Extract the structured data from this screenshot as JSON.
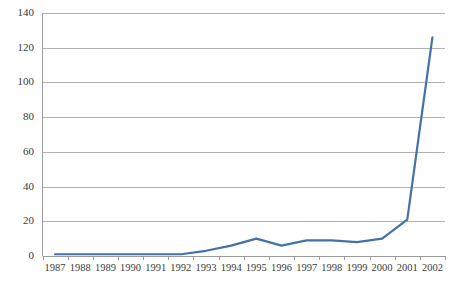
{
  "chart_data": {
    "type": "line",
    "title": "",
    "subtitle": "",
    "xlabel": "",
    "ylabel": "",
    "categories": [
      "1987",
      "1988",
      "1989",
      "1990",
      "1991",
      "1992",
      "1993",
      "1994",
      "1995",
      "1996",
      "1997",
      "1998",
      "1999",
      "2000",
      "2001",
      "2002"
    ],
    "series": [
      {
        "name": "Series 1",
        "values": [
          1,
          1,
          1,
          1,
          1,
          1,
          3,
          6,
          10,
          6,
          9,
          9,
          8,
          10,
          21,
          126
        ],
        "color": "#4472a8"
      }
    ],
    "ylim": [
      0,
      140
    ],
    "yticks": [
      0,
      20,
      40,
      60,
      80,
      100,
      120,
      140
    ],
    "ytick_labels": [
      "0",
      "20",
      "40",
      "60",
      "80",
      "100",
      "120",
      "140"
    ],
    "grid": "horizontal",
    "legend": "none",
    "plot_background": "#ffffff",
    "gridline_color": "#b3b3b3",
    "axis_color": "#9a9a9a",
    "tick_label_color": "#3a3a3a"
  }
}
